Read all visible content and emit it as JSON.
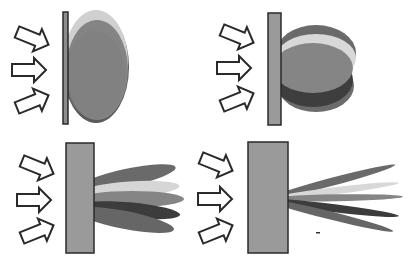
{
  "diagram": {
    "colors": {
      "background": "#ffffff",
      "surface_fill": "#9a9a9a",
      "surface_stroke": "#2a2a2a",
      "arrow_fill": "#ffffff",
      "arrow_stroke": "#2a2a2a",
      "lobe_dark": "#4a4a4a",
      "lobe_mid": "#6e6e6e",
      "lobe_light": "#d4d4d4",
      "lobe_main": "#858585",
      "lobe_outer": "#5e5e5e"
    },
    "panels": [
      {
        "id": "panel-top-left",
        "label": "",
        "surface": "thin plate",
        "lobe_shape": "broad ellipse (diffuse)",
        "incident_arrows": 3
      },
      {
        "id": "panel-top-right",
        "label": "",
        "surface": "plate",
        "lobe_shape": "stacked ellipses (semi-diffuse)",
        "incident_arrows": 3
      },
      {
        "id": "panel-bottom-left",
        "label": "",
        "surface": "thick block",
        "lobe_shape": "fan of elongated lobes (glossy)",
        "incident_arrows": 3
      },
      {
        "id": "panel-bottom-right",
        "label": "",
        "surface": "thick block",
        "lobe_shape": "fan of narrow spikes (specular)",
        "incident_arrows": 3
      }
    ]
  }
}
